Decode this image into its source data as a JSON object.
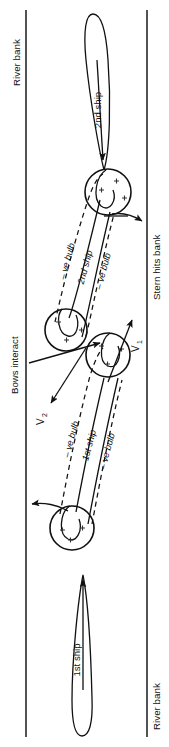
{
  "figure": {
    "orientation_note": "diagram rendered rotated 90 degrees; all text reads bottom-to-top",
    "banks": {
      "left_label": "River bank",
      "right_top_label": "Stern hits bank",
      "right_bottom_label": "River bank"
    },
    "ships": {
      "first": "1st ship",
      "second": "2nd ship"
    },
    "annotations": {
      "bows_interact": "Bows interact",
      "stern_hits_bank": "Stern hits bank",
      "negative_bulb": "– ve bulb",
      "velocity_1": "V",
      "velocity_1_sub": "1",
      "velocity_2": "V",
      "velocity_2_sub": "2"
    },
    "pressure_marks": {
      "symbol": "+",
      "meaning": "positive pressure field around hull"
    },
    "colors": {
      "ink": "#111111",
      "bank": "#1a1a1a",
      "background": "#ffffff"
    }
  }
}
